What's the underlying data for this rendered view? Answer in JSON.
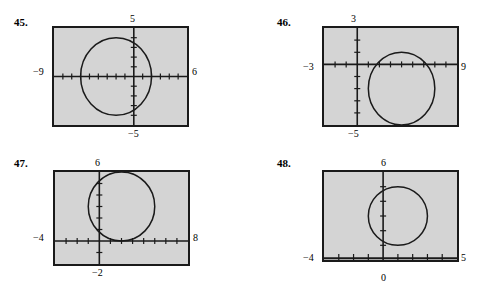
{
  "page": {
    "background": "#ffffff",
    "screen_fill": "#d4d4d4",
    "ink": "#1a1a1a",
    "exercise_count": 4
  },
  "panels": [
    {
      "number": "45.",
      "labels": {
        "top": "5",
        "left": "−9",
        "right": "6",
        "bottom": "−5"
      },
      "window": {
        "xmin": -9,
        "xmax": 6,
        "ymin": -5,
        "ymax": 5,
        "xscl": 1,
        "yscl": 1
      },
      "graph": {
        "type": "circle",
        "center_x": -2,
        "center_y": 0,
        "radius": 4
      }
    },
    {
      "number": "46.",
      "labels": {
        "top": "3",
        "left": "−3",
        "right": "9",
        "bottom": "−5"
      },
      "window": {
        "xmin": -3,
        "xmax": 9,
        "ymin": -5,
        "ymax": 3,
        "xscl": 1,
        "yscl": 1
      },
      "graph": {
        "type": "circle",
        "center_x": 4,
        "center_y": -2,
        "radius": 3
      }
    },
    {
      "number": "47.",
      "labels": {
        "top": "6",
        "left": "−4",
        "right": "8",
        "bottom": "−2"
      },
      "window": {
        "xmin": -4,
        "xmax": 8,
        "ymin": -2,
        "ymax": 6,
        "xscl": 1,
        "yscl": 1
      },
      "graph": {
        "type": "circle",
        "center_x": 2,
        "center_y": 3,
        "radius": 3
      }
    },
    {
      "number": "48.",
      "labels": {
        "top": "6",
        "left": "−4",
        "right": "5",
        "bottom": "0"
      },
      "window": {
        "xmin": -4,
        "xmax": 5,
        "ymin": 0,
        "ymax": 6,
        "xscl": 1,
        "yscl": 1
      },
      "graph": {
        "type": "circle",
        "center_x": 1,
        "center_y": 3,
        "radius": 2
      }
    }
  ]
}
